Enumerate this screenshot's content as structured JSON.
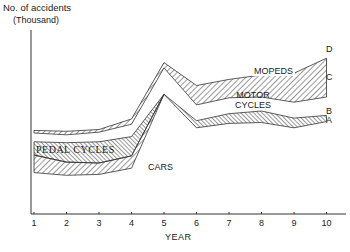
{
  "chart_data": {
    "type": "area",
    "title": "",
    "ylabel": "No. of accidents",
    "ylabel_unit": "(Thousand)",
    "xlabel": "YEAR",
    "x": [
      1,
      2,
      3,
      4,
      5,
      6,
      7,
      8,
      9,
      10
    ],
    "categories": [
      "1",
      "2",
      "3",
      "4",
      "5",
      "6",
      "7",
      "8",
      "9",
      "10"
    ],
    "ylim": [
      0,
      200
    ],
    "grid": false,
    "stacked": true,
    "series": [
      {
        "name": "CARS",
        "boundary": "A",
        "values": [
          47,
          44,
          45,
          52,
          75,
          54,
          57,
          58,
          54,
          59
        ]
      },
      {
        "name": "PEDAL CYCLES",
        "values": [
          20,
          15,
          13,
          14,
          0,
          0,
          0,
          0,
          0,
          0
        ]
      },
      {
        "name": "MOTOR CYCLES (upper band to B)",
        "boundary": "B",
        "values": [
          48,
          49,
          50,
          52,
          80,
          58,
          61,
          61,
          56,
          63
        ]
      },
      {
        "name": "MOTOR CYCLES",
        "values": [
          60,
          62,
          63,
          68,
          100,
          90,
          96,
          97,
          98,
          105
        ]
      },
      {
        "name": "MOPEDS",
        "boundary": "D",
        "values": [
          62,
          64,
          66,
          73,
          106,
          100,
          106,
          109,
          112,
          124
        ]
      }
    ],
    "boundaries": {
      "A": [
        67,
        59,
        58,
        66,
        136,
        98,
        103,
        104,
        98,
        105
      ],
      "B": [
        82,
        81,
        82,
        88,
        136,
        106,
        114,
        117,
        109,
        112
      ],
      "C": [
        92,
        90,
        93,
        102,
        166,
        124,
        132,
        133,
        127,
        133
      ],
      "D": [
        95,
        94,
        96,
        108,
        172,
        146,
        153,
        158,
        160,
        177
      ]
    },
    "annotations": [
      "CARS",
      "PEDAL CYCLES",
      "MOTOR CYCLES",
      "MOPEDS",
      "A",
      "B",
      "C",
      "D"
    ]
  },
  "axis": {
    "ylabel_line1": "No. of accidents",
    "ylabel_line2": "(Thousand)",
    "xlabel": "YEAR",
    "ticks": [
      "1",
      "2",
      "3",
      "4",
      "5",
      "6",
      "7",
      "8",
      "9",
      "10"
    ]
  },
  "labels": {
    "cars": "CARS",
    "pedal": "PEDAL CYCLES",
    "motor1": "MOTOR",
    "motor2": "CYCLES",
    "mopeds": "MOPEDS",
    "a": "A",
    "b": "B",
    "c": "C",
    "d": "D"
  },
  "caption": "Number of road accidents over 10 years, by class of vehicle"
}
